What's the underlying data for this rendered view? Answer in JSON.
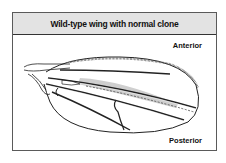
{
  "figure": {
    "title": "Wild-type wing with normal clone",
    "labels": {
      "anterior": "Anterior",
      "posterior": "Posterior"
    },
    "colors": {
      "header_bg": "#e3e3e3",
      "clone_fill": "#c8c8c8",
      "outline": "#222222"
    }
  }
}
